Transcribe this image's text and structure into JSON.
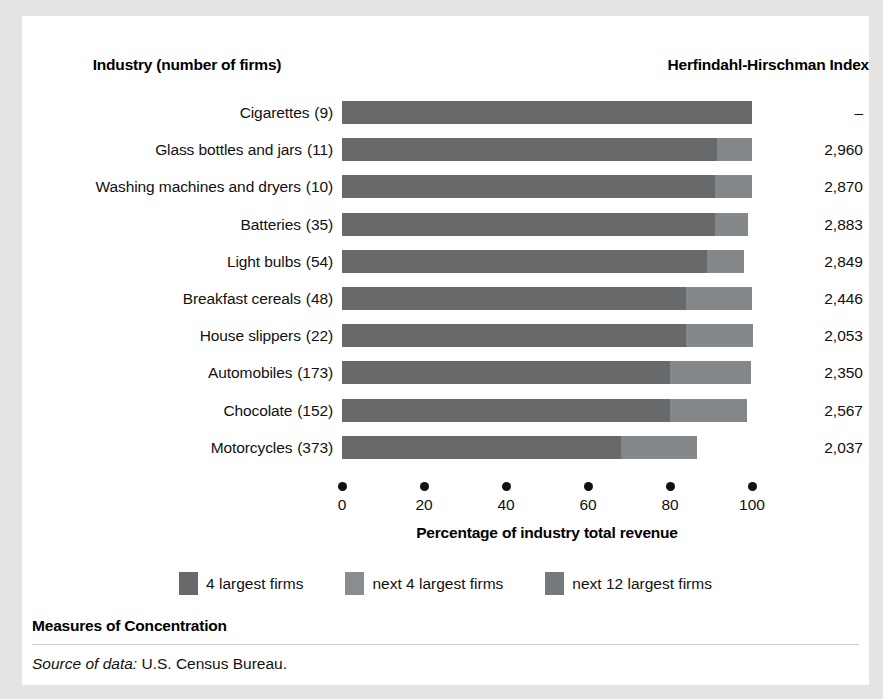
{
  "header": {
    "industry_label": "Industry (number of firms)",
    "hhi_label": "Herfindahl-Hirschman Index"
  },
  "axis": {
    "title": "Percentage of industry total revenue",
    "ticks": [
      "0",
      "20",
      "40",
      "60",
      "80",
      "100"
    ],
    "tick_values": [
      0,
      20,
      40,
      60,
      80,
      100
    ],
    "min": 0,
    "max": 100
  },
  "legend": {
    "items": [
      {
        "label": "4 largest firms",
        "color": "#67696b",
        "key": "s1"
      },
      {
        "label": "next 4 largest firms",
        "color": "#8a8d8f",
        "key": "s2"
      },
      {
        "label": "next 12 largest firms",
        "color": "#76797b",
        "key": "s3"
      }
    ]
  },
  "footer": {
    "title": "Measures of Concentration",
    "source_prefix": "Source of data:",
    "source_text": "U.S. Census Bureau."
  },
  "chart_data": {
    "type": "bar",
    "orientation": "horizontal",
    "stacked": true,
    "title": "Measures of Concentration",
    "xlabel": "Percentage of industry total revenue",
    "ylabel": "Industry (number of firms)",
    "xlim": [
      0,
      100
    ],
    "grid": false,
    "legend_position": "bottom-center",
    "series": [
      {
        "name": "4 largest firms",
        "values": [
          100.0,
          91.5,
          91.0,
          91.0,
          89.0,
          84.0,
          84.0,
          80.0,
          80.0,
          68.0
        ]
      },
      {
        "name": "next 4 largest firms",
        "values": [
          0.0,
          8.5,
          8.5,
          8.0,
          7.0,
          16.0,
          16.0,
          19.5,
          17.0,
          18.7
        ]
      },
      {
        "name": "next 12 largest firms",
        "values": [
          0.0,
          0.0,
          0.0,
          0.0,
          0.0,
          0.0,
          0.0,
          0.0,
          0.0,
          0.0
        ]
      }
    ],
    "categories": [
      "Cigarettes (9)",
      "Glass bottles and jars (11)",
      "Washing machines and dryers (10)",
      "Batteries (35)",
      "Light bulbs (54)",
      "Breakfast cereals (48)",
      "House slippers (22)",
      "Automobiles (173)",
      "Chocolate (152)",
      "Motorcycles (373)"
    ],
    "rows": [
      {
        "industry": "Cigarettes",
        "firms": "(9)",
        "seg1": 100.0,
        "seg2": 0.0,
        "hhi": "–"
      },
      {
        "industry": "Glass bottles and jars",
        "firms": "(11)",
        "seg1": 91.5,
        "seg2": 8.5,
        "hhi": "2,960"
      },
      {
        "industry": "Washing machines and dryers",
        "firms": "(10)",
        "seg1": 91.0,
        "seg2": 9.0,
        "hhi": "2,870"
      },
      {
        "industry": "Batteries",
        "firms": "(35)",
        "seg1": 91.0,
        "seg2": 8.0,
        "hhi": "2,883"
      },
      {
        "industry": "Light bulbs",
        "firms": "(54)",
        "seg1": 89.0,
        "seg2": 9.0,
        "hhi": "2,849"
      },
      {
        "industry": "Breakfast cereals",
        "firms": "(48)",
        "seg1": 84.0,
        "seg2": 16.0,
        "hhi": "2,446"
      },
      {
        "industry": "House slippers",
        "firms": "(22)",
        "seg1": 84.0,
        "seg2": 16.3,
        "hhi": "2,053"
      },
      {
        "industry": "Automobiles",
        "firms": "(173)",
        "seg1": 80.0,
        "seg2": 19.7,
        "hhi": "2,350"
      },
      {
        "industry": "Chocolate",
        "firms": "(152)",
        "seg1": 80.0,
        "seg2": 18.7,
        "hhi": "2,567"
      },
      {
        "industry": "Motorcycles",
        "firms": "(373)",
        "seg1": 68.0,
        "seg2": 18.7,
        "hhi": "2,037"
      }
    ]
  }
}
